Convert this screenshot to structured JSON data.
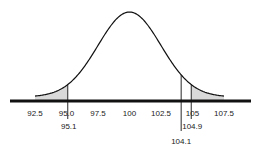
{
  "chart_data": {
    "type": "area",
    "title": "",
    "xlabel": "",
    "ylabel": "",
    "distribution": "normal",
    "mean": 100,
    "sd": 2.5,
    "xlim": [
      92.5,
      107.5
    ],
    "grid": false,
    "legend": null,
    "x_ticks": [
      "92.5",
      "95.0",
      "97.5",
      "100",
      "102.5",
      "105",
      "107.5"
    ],
    "x_tick_values": [
      92.5,
      95.0,
      97.5,
      100,
      102.5,
      105,
      107.5
    ],
    "markers": [
      {
        "value": 95.1,
        "label": "95.1",
        "label_row": 1
      },
      {
        "value": 104.1,
        "label": "104.1",
        "label_row": 2
      },
      {
        "value": 104.9,
        "label": "104.9",
        "label_row": 1
      }
    ],
    "shaded_regions": [
      {
        "from": 92.5,
        "to": 95.1,
        "side": "left tail"
      },
      {
        "from": 104.9,
        "to": 107.5,
        "side": "right tail"
      }
    ],
    "colors": {
      "curve": "#111111",
      "axis": "#111111",
      "shade": "#d9d9d9",
      "text": "#222222"
    }
  }
}
